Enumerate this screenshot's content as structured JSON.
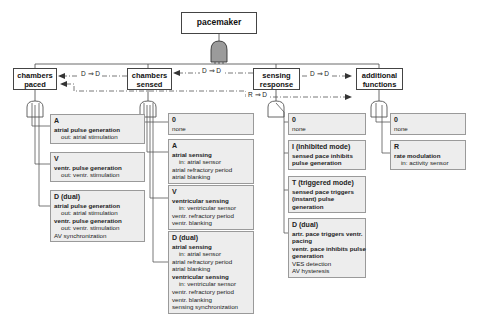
{
  "diagram": {
    "root": "pacemaker",
    "constraints": [
      {
        "label": "D ⇒ D"
      },
      {
        "label": "D ⇒ D"
      },
      {
        "label": "D ⇒ D"
      },
      {
        "label": "R ⇒ D"
      }
    ],
    "categories": [
      {
        "label": "chambers paced",
        "features": [
          {
            "code": "A",
            "lines": [
              {
                "text": "atrial pulse generation",
                "bold": true
              },
              {
                "text": "out: atrial stimulation",
                "indent": true
              }
            ]
          },
          {
            "code": "V",
            "lines": [
              {
                "text": "ventr. pulse generation",
                "bold": true
              },
              {
                "text": "out: ventr. stimulation",
                "indent": true
              }
            ]
          },
          {
            "code": "D (dual)",
            "lines": [
              {
                "text": "atrial pulse generation",
                "bold": true
              },
              {
                "text": "out: atrial stimulation",
                "indent": true
              },
              {
                "text": "ventr. pulse generation",
                "bold": true
              },
              {
                "text": "out: ventr. stimulation",
                "indent": true
              },
              {
                "text": "AV synchronization"
              }
            ]
          }
        ]
      },
      {
        "label": "chambers sensed",
        "features": [
          {
            "code": "0",
            "lines": [
              {
                "text": "none"
              }
            ]
          },
          {
            "code": "A",
            "lines": [
              {
                "text": "atrial sensing",
                "bold": true
              },
              {
                "text": "in: atrial sensor",
                "indent": true
              },
              {
                "text": "atrial refractory period"
              },
              {
                "text": "atrial blanking"
              }
            ]
          },
          {
            "code": "V",
            "lines": [
              {
                "text": "ventricular sensing",
                "bold": true
              },
              {
                "text": "in: ventricular sensor",
                "indent": true
              },
              {
                "text": "ventr. refractory period"
              },
              {
                "text": "ventr. blanking"
              }
            ]
          },
          {
            "code": "D (dual)",
            "lines": [
              {
                "text": "atrial sensing",
                "bold": true
              },
              {
                "text": "in: atrial sensor",
                "indent": true
              },
              {
                "text": "atrial refractory period"
              },
              {
                "text": "atrial blanking"
              },
              {
                "text": "ventricular sensing",
                "bold": true
              },
              {
                "text": "in: ventricular sensor",
                "indent": true
              },
              {
                "text": "ventr. refractory period"
              },
              {
                "text": "ventr. blanking"
              },
              {
                "text": "sensing synchronization"
              }
            ]
          }
        ]
      },
      {
        "label": "sensing response",
        "features": [
          {
            "code": "0",
            "lines": [
              {
                "text": "none"
              }
            ]
          },
          {
            "code": "I (inhibited mode)",
            "lines": [
              {
                "text": "sensed pace inhibits",
                "bold": true
              },
              {
                "text": "pulse generation",
                "bold": true
              }
            ]
          },
          {
            "code": "T (triggered mode)",
            "lines": [
              {
                "text": "sensed pace triggers",
                "bold": true
              },
              {
                "text": "(instant) pulse",
                "bold": true
              },
              {
                "text": "generation",
                "bold": true
              }
            ]
          },
          {
            "code": "D (dual)",
            "lines": [
              {
                "text": "artr. pace triggers ventr.",
                "bold": true
              },
              {
                "text": "pacing",
                "bold": true
              },
              {
                "text": "ventr. pace inhibits pulse",
                "bold": true
              },
              {
                "text": "generation",
                "bold": true
              },
              {
                "text": "VES detection"
              },
              {
                "text": "AV hysteresis"
              }
            ]
          }
        ]
      },
      {
        "label": "additional functions",
        "features": [
          {
            "code": "0",
            "lines": [
              {
                "text": "none"
              }
            ]
          },
          {
            "code": "R",
            "lines": [
              {
                "text": "rate modulation",
                "bold": true
              },
              {
                "text": "in: activity sensor",
                "indent": true
              }
            ]
          }
        ]
      }
    ]
  }
}
